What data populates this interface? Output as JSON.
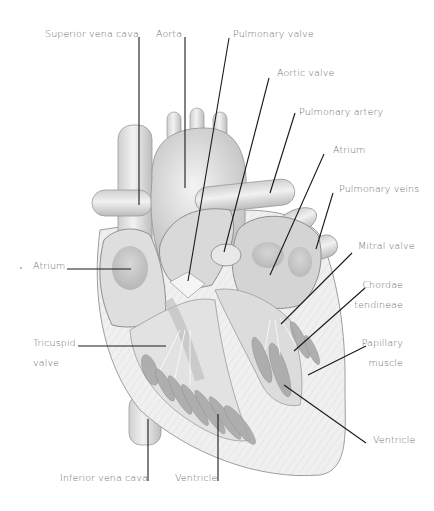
{
  "diagram": {
    "type": "anatomical-illustration",
    "labels": [
      {
        "id": "superior-vena-cava",
        "text": "Superior vena cava",
        "x": 45,
        "y": 28,
        "line": [
          139,
          37,
          139,
          205
        ]
      },
      {
        "id": "aorta",
        "text": "Aorta",
        "x": 156,
        "y": 28,
        "line": [
          185,
          37,
          185,
          188
        ]
      },
      {
        "id": "pulmonary-valve",
        "text": "Pulmonary valve",
        "x": 233,
        "y": 28,
        "line": [
          229,
          38,
          188,
          281
        ]
      },
      {
        "id": "aortic-valve",
        "text": "Aortic valve",
        "x": 277,
        "y": 67,
        "line": [
          269,
          78,
          224,
          252
        ]
      },
      {
        "id": "pulmonary-artery",
        "text": "Pulmonary artery",
        "x": 299,
        "y": 106,
        "line": [
          295,
          113,
          270,
          193
        ]
      },
      {
        "id": "atrium-left-side",
        "text": "Atrium",
        "x": 333,
        "y": 144,
        "line": [
          324,
          154,
          270,
          275
        ]
      },
      {
        "id": "pulmonary-veins",
        "text": "Pulmonary veins",
        "x": 339,
        "y": 183,
        "line": [
          333,
          193,
          316,
          249
        ]
      },
      {
        "id": "mitral-valve",
        "text": "Mitral valve",
        "x": 358,
        "y": 240,
        "line": [
          352,
          253,
          281,
          324
        ]
      },
      {
        "id": "chordae-tendineae",
        "text": [
          "Chordae",
          "tendineae"
        ],
        "x": 368,
        "y": 279,
        "line": [
          365,
          288,
          294,
          351
        ]
      },
      {
        "id": "papillary-muscle",
        "text": [
          "Papillary",
          "muscle"
        ],
        "x": 371,
        "y": 337,
        "line": [
          366,
          346,
          308,
          375
        ]
      },
      {
        "id": "ventricle-right-side",
        "text": "Ventricle",
        "x": 373,
        "y": 434,
        "line": [
          366,
          443,
          284,
          385
        ]
      },
      {
        "id": "atrium-right-side",
        "text": "Atrium",
        "x": 33,
        "y": 260,
        "line": [
          67,
          269,
          131,
          269
        ]
      },
      {
        "id": "tricuspid-valve",
        "text": [
          "Tricuspid",
          "valve"
        ],
        "x": 33,
        "y": 337,
        "line": [
          78,
          346,
          166,
          346
        ]
      },
      {
        "id": "inferior-vena-cava",
        "text": "Inferior vena cava",
        "x": 60,
        "y": 472,
        "line": [
          148,
          419,
          148,
          481
        ]
      },
      {
        "id": "ventricle-bottom",
        "text": "Ventricle",
        "x": 175,
        "y": 472,
        "line": [
          218,
          414,
          218,
          481
        ]
      }
    ]
  },
  "colors": {
    "background": "#ffffff",
    "label_text": "#6e6e6e",
    "leader_line": "#1a1a1a",
    "tissue_light": "#e6e6e6",
    "tissue_mid": "#c8c8c8",
    "tissue_dark": "#9a9a9a",
    "outline": "#8a8a8a"
  }
}
